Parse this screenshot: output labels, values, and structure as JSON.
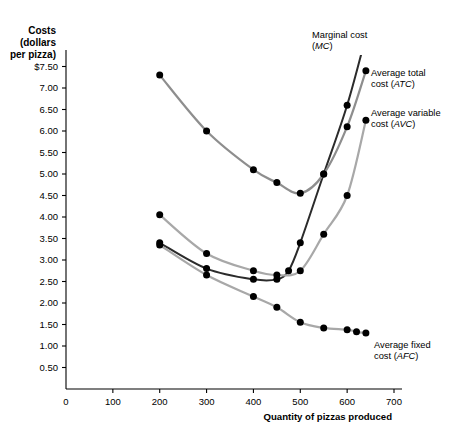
{
  "chart_data": {
    "type": "line",
    "title": "",
    "xlabel": "Quantity of pizzas produced",
    "ylabel": "Costs (dollars per pizza)",
    "ylabel_lines": [
      "Costs",
      "(dollars",
      "per pizza)"
    ],
    "xlim": [
      0,
      700
    ],
    "ylim": [
      0,
      7.75
    ],
    "grid": false,
    "legend_position": "inline-annotations",
    "xticks": [
      0,
      100,
      200,
      300,
      400,
      500,
      600,
      700
    ],
    "xticklabels": [
      "0",
      "100",
      "200",
      "300",
      "400",
      "500",
      "600",
      "700"
    ],
    "yticks": [
      0.5,
      1.0,
      1.5,
      2.0,
      2.5,
      3.0,
      3.5,
      4.0,
      4.5,
      5.0,
      5.5,
      6.0,
      6.5,
      7.0,
      7.5
    ],
    "yticklabels": [
      "0.50",
      "1.00",
      "1.50",
      "2.00",
      "2.50",
      "3.00",
      "3.50",
      "4.00",
      "4.50",
      "5.00",
      "5.50",
      "6.00",
      "6.50",
      "7.00",
      "$7.50"
    ],
    "series": [
      {
        "name": "Marginal cost (MC)",
        "short": "MC",
        "color": "#2b2b2b",
        "width": 2.0,
        "label_lines": [
          "Marginal cost",
          "(MC)"
        ],
        "label_italic": "MC",
        "x": [
          200,
          300,
          400,
          450,
          475,
          500,
          550,
          600,
          640
        ],
        "y": [
          3.4,
          2.8,
          2.55,
          2.55,
          2.75,
          3.4,
          5.0,
          6.6,
          8.2
        ]
      },
      {
        "name": "Average total cost (ATC)",
        "short": "ATC",
        "color": "#8e8e8e",
        "width": 2.2,
        "label_lines": [
          "Average total",
          "cost (ATC)"
        ],
        "label_italic": "ATC",
        "x": [
          200,
          300,
          400,
          450,
          500,
          550,
          600,
          640
        ],
        "y": [
          7.3,
          6.0,
          5.1,
          4.8,
          4.55,
          5.0,
          6.1,
          7.4
        ]
      },
      {
        "name": "Average variable cost (AVC)",
        "short": "AVC",
        "color": "#a8a8a8",
        "width": 2.2,
        "label_lines": [
          "Average variable",
          "cost (AVC)"
        ],
        "label_italic": "AVC",
        "x": [
          200,
          300,
          400,
          450,
          500,
          550,
          600,
          640
        ],
        "y": [
          4.05,
          3.15,
          2.75,
          2.65,
          2.75,
          3.6,
          4.5,
          6.25
        ]
      },
      {
        "name": "Average fixed cost (AFC)",
        "short": "AFC",
        "color": "#a8a8a8",
        "width": 2.2,
        "label_lines": [
          "Average fixed",
          "cost (AFC)"
        ],
        "label_italic": "AFC",
        "x": [
          200,
          300,
          400,
          450,
          500,
          550,
          600,
          620,
          640
        ],
        "y": [
          3.35,
          2.65,
          2.15,
          1.9,
          1.55,
          1.42,
          1.38,
          1.33,
          1.3
        ]
      }
    ],
    "annotations": [
      {
        "text": "Marginal cost (MC)",
        "series": "MC"
      },
      {
        "text": "Average total cost (ATC)",
        "series": "ATC"
      },
      {
        "text": "Average variable cost (AVC)",
        "series": "AVC"
      },
      {
        "text": "Average fixed cost (AFC)",
        "series": "AFC"
      }
    ]
  },
  "axis": {
    "y_title_line1": "Costs",
    "y_title_line2": "(dollars",
    "y_title_line3": "per pizza)",
    "x_title": "Quantity of pizzas produced",
    "origin_label": "0"
  },
  "labels": {
    "mc_l1": "Marginal cost",
    "mc_l2_pre": "(",
    "mc_l2_it": "MC",
    "mc_l2_post": ")",
    "atc_l1": "Average total",
    "atc_l2_pre": "cost (",
    "atc_l2_it": "ATC",
    "atc_l2_post": ")",
    "avc_l1": "Average variable",
    "avc_l2_pre": "cost (",
    "avc_l2_it": "AVC",
    "avc_l2_post": ")",
    "afc_l1": "Average fixed",
    "afc_l2_pre": "cost (",
    "afc_l2_it": "AFC",
    "afc_l2_post": ")"
  },
  "colors": {
    "mc": "#2b2b2b",
    "atc": "#8e8e8e",
    "avc": "#a8a8a8",
    "afc": "#a8a8a8",
    "axis": "#000000",
    "background": "#ffffff"
  }
}
